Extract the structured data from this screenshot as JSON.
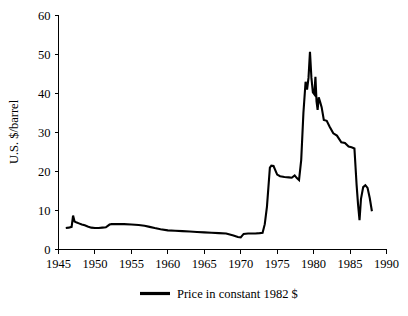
{
  "chart_data": {
    "type": "line",
    "title": "",
    "xlabel": "",
    "ylabel": "U.S. $/barrel",
    "xlim": [
      1945,
      1990
    ],
    "ylim": [
      0,
      60
    ],
    "grid": false,
    "legend_position": "bottom-center",
    "x_ticks": [
      1945,
      1950,
      1955,
      1960,
      1965,
      1970,
      1975,
      1980,
      1985,
      1990
    ],
    "y_ticks": [
      0,
      10,
      20,
      30,
      40,
      50,
      60
    ],
    "x_tick_labels": [
      "1945",
      "1950",
      "1955",
      "1960",
      "1965",
      "1970",
      "1975",
      "1980",
      "1985",
      "1990"
    ],
    "y_tick_labels": [
      "0",
      "10",
      "20",
      "30",
      "40",
      "50",
      "60"
    ],
    "series": [
      {
        "name": "Price in constant 1982 $",
        "color": "#000000",
        "x": [
          1946.0,
          1946.4,
          1946.8,
          1947.0,
          1947.2,
          1947.5,
          1947.8,
          1948.2,
          1948.6,
          1949.0,
          1949.5,
          1950.0,
          1950.5,
          1951.0,
          1951.5,
          1952.0,
          1952.3,
          1952.8,
          1953.3,
          1954.0,
          1955.0,
          1956.0,
          1956.8,
          1957.5,
          1958.2,
          1959.0,
          1960.0,
          1961.0,
          1962.0,
          1963.0,
          1964.0,
          1965.0,
          1966.0,
          1967.0,
          1968.0,
          1969.0,
          1969.6,
          1970.0,
          1970.4,
          1971.0,
          1972.0,
          1972.6,
          1973.0,
          1973.3,
          1973.6,
          1973.8,
          1974.0,
          1974.2,
          1974.5,
          1975.0,
          1975.4,
          1976.0,
          1976.6,
          1977.0,
          1977.4,
          1977.7,
          1978.0,
          1978.3,
          1978.6,
          1978.9,
          1979.1,
          1979.3,
          1979.5,
          1979.7,
          1979.9,
          1980.1,
          1980.25,
          1980.4,
          1980.55,
          1980.7,
          1980.9,
          1981.1,
          1981.4,
          1981.8,
          1982.2,
          1982.7,
          1983.2,
          1983.8,
          1984.3,
          1984.8,
          1985.2,
          1985.6,
          1985.9,
          1986.1,
          1986.3,
          1986.5,
          1986.8,
          1987.1,
          1987.4,
          1987.7,
          1988.0
        ],
        "values": [
          5.5,
          5.6,
          5.8,
          8.7,
          7.2,
          6.9,
          6.7,
          6.4,
          6.2,
          5.9,
          5.6,
          5.5,
          5.5,
          5.6,
          5.7,
          6.4,
          6.5,
          6.5,
          6.5,
          6.5,
          6.4,
          6.3,
          6.1,
          5.8,
          5.5,
          5.2,
          4.9,
          4.8,
          4.7,
          4.6,
          4.5,
          4.4,
          4.3,
          4.2,
          4.1,
          3.6,
          3.2,
          3.1,
          4.0,
          4.1,
          4.1,
          4.2,
          4.3,
          6.5,
          11.0,
          16.0,
          21.0,
          21.5,
          21.4,
          19.2,
          18.8,
          18.6,
          18.5,
          18.4,
          19.0,
          18.3,
          17.8,
          23.0,
          35.0,
          43.0,
          41.0,
          44.0,
          50.7,
          44.0,
          40.3,
          39.8,
          44.3,
          38.0,
          35.8,
          39.0,
          37.8,
          36.5,
          33.2,
          33.0,
          31.5,
          29.8,
          29.2,
          27.5,
          27.3,
          26.4,
          26.2,
          25.9,
          16.5,
          11.5,
          7.5,
          13.0,
          16.0,
          16.5,
          15.8,
          13.2,
          9.8
        ]
      }
    ],
    "legend": [
      {
        "label": "Price in constant 1982 $",
        "color": "#000000"
      }
    ],
    "annotations": []
  }
}
